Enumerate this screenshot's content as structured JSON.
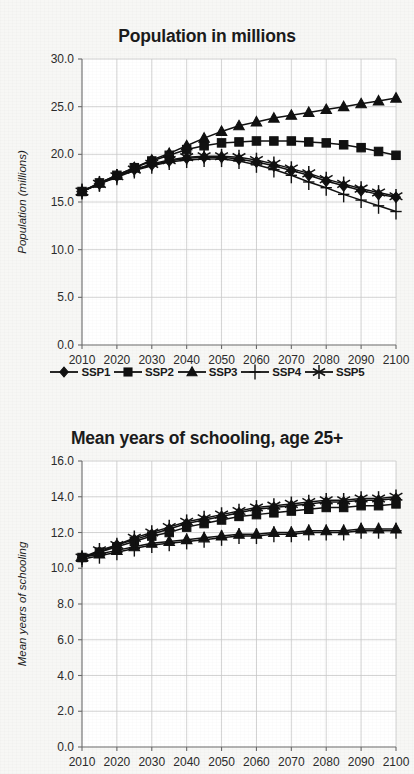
{
  "page": {
    "background_color": "#f7f7f5",
    "ink_color": "#111111",
    "grid_color": "#c9c9c9"
  },
  "legend": {
    "position": "below-top-chart",
    "items": [
      {
        "label": "SSP1",
        "marker": "diamond-marker-icon"
      },
      {
        "label": "SSP2",
        "marker": "square-marker-icon"
      },
      {
        "label": "SSP3",
        "marker": "triangle-marker-icon"
      },
      {
        "label": "SSP4",
        "marker": "plus-marker-icon"
      },
      {
        "label": "SSP5",
        "marker": "asterisk-marker-icon"
      }
    ]
  },
  "chart_data": [
    {
      "id": "population",
      "type": "line",
      "title": "Population in millions",
      "xlabel": "",
      "ylabel": "Population (millions)",
      "x": [
        2010,
        2015,
        2020,
        2025,
        2030,
        2035,
        2040,
        2045,
        2050,
        2055,
        2060,
        2065,
        2070,
        2075,
        2080,
        2085,
        2090,
        2095,
        2100
      ],
      "xlim": [
        2010,
        2100
      ],
      "ylim": [
        0.0,
        30.0
      ],
      "xticks": [
        2010,
        2020,
        2030,
        2040,
        2050,
        2060,
        2070,
        2080,
        2090,
        2100
      ],
      "xtick_labels": [
        "2010",
        "2020",
        "2030",
        "2040",
        "2050",
        "2060",
        "2070",
        "2080",
        "2090",
        "2100"
      ],
      "yticks": [
        0.0,
        5.0,
        10.0,
        15.0,
        20.0,
        25.0,
        30.0
      ],
      "ytick_labels": [
        "0.0",
        "5.0",
        "10.0",
        "15.0",
        "20.0",
        "25.0",
        "30.0"
      ],
      "grid": true,
      "legend_position": "below",
      "series": [
        {
          "name": "SSP1",
          "marker": "diamond",
          "values": [
            16.1,
            16.9,
            17.7,
            18.4,
            18.9,
            19.3,
            19.6,
            19.7,
            19.7,
            19.5,
            19.2,
            18.8,
            18.3,
            17.8,
            17.2,
            16.7,
            16.2,
            15.8,
            15.5
          ]
        },
        {
          "name": "SSP2",
          "marker": "square",
          "values": [
            16.1,
            17.0,
            17.8,
            18.6,
            19.3,
            19.9,
            20.5,
            20.9,
            21.2,
            21.3,
            21.4,
            21.4,
            21.4,
            21.3,
            21.2,
            21.0,
            20.7,
            20.3,
            19.9
          ]
        },
        {
          "name": "SSP3",
          "marker": "triangle",
          "values": [
            16.1,
            17.0,
            17.8,
            18.6,
            19.4,
            20.1,
            20.9,
            21.7,
            22.4,
            23.0,
            23.4,
            23.8,
            24.1,
            24.4,
            24.7,
            25.0,
            25.3,
            25.6,
            25.9
          ]
        },
        {
          "name": "SSP4",
          "marker": "plus",
          "values": [
            16.1,
            16.9,
            17.6,
            18.3,
            18.8,
            19.2,
            19.4,
            19.5,
            19.5,
            19.3,
            18.9,
            18.4,
            17.8,
            17.1,
            16.5,
            15.8,
            15.2,
            14.6,
            14.0
          ]
        },
        {
          "name": "SSP5",
          "marker": "asterisk",
          "values": [
            16.1,
            16.9,
            17.7,
            18.4,
            19.0,
            19.4,
            19.7,
            19.8,
            19.8,
            19.7,
            19.4,
            19.0,
            18.5,
            18.0,
            17.4,
            16.9,
            16.4,
            16.0,
            15.6
          ]
        }
      ]
    },
    {
      "id": "schooling",
      "type": "line",
      "title": "Mean years of schooling, age 25+",
      "xlabel": "",
      "ylabel": "Mean years of schooling",
      "x": [
        2010,
        2015,
        2020,
        2025,
        2030,
        2035,
        2040,
        2045,
        2050,
        2055,
        2060,
        2065,
        2070,
        2075,
        2080,
        2085,
        2090,
        2095,
        2100
      ],
      "xlim": [
        2010,
        2100
      ],
      "ylim": [
        0.0,
        16.0
      ],
      "xticks": [
        2010,
        2020,
        2030,
        2040,
        2050,
        2060,
        2070,
        2080,
        2090,
        2100
      ],
      "xtick_labels": [
        "2010",
        "2020",
        "2030",
        "2040",
        "2050",
        "2060",
        "2070",
        "2080",
        "2090",
        "2100"
      ],
      "yticks": [
        0.0,
        2.0,
        4.0,
        6.0,
        8.0,
        10.0,
        12.0,
        14.0,
        16.0
      ],
      "ytick_labels": [
        "0.0",
        "2.0",
        "4.0",
        "6.0",
        "8.0",
        "10.0",
        "12.0",
        "14.0",
        "16.0"
      ],
      "grid": true,
      "legend_position": "none",
      "series": [
        {
          "name": "SSP1",
          "marker": "diamond",
          "values": [
            10.6,
            10.9,
            11.3,
            11.6,
            11.9,
            12.2,
            12.5,
            12.7,
            12.9,
            13.1,
            13.3,
            13.4,
            13.5,
            13.6,
            13.7,
            13.7,
            13.8,
            13.8,
            13.9
          ]
        },
        {
          "name": "SSP2",
          "marker": "square",
          "values": [
            10.6,
            10.9,
            11.2,
            11.5,
            11.8,
            12.0,
            12.3,
            12.5,
            12.7,
            12.9,
            13.0,
            13.1,
            13.2,
            13.3,
            13.4,
            13.4,
            13.5,
            13.5,
            13.6
          ]
        },
        {
          "name": "SSP3",
          "marker": "triangle",
          "values": [
            10.6,
            10.8,
            11.0,
            11.2,
            11.4,
            11.5,
            11.6,
            11.7,
            11.8,
            11.9,
            11.9,
            12.0,
            12.0,
            12.1,
            12.1,
            12.1,
            12.2,
            12.2,
            12.2
          ]
        },
        {
          "name": "SSP4",
          "marker": "plus",
          "values": [
            10.5,
            10.7,
            10.9,
            11.1,
            11.3,
            11.4,
            11.5,
            11.6,
            11.7,
            11.8,
            11.8,
            11.9,
            11.9,
            12.0,
            12.0,
            12.0,
            12.1,
            12.1,
            12.1
          ]
        },
        {
          "name": "SSP5",
          "marker": "asterisk",
          "values": [
            10.6,
            11.0,
            11.3,
            11.7,
            12.0,
            12.3,
            12.6,
            12.8,
            13.0,
            13.2,
            13.4,
            13.5,
            13.6,
            13.7,
            13.8,
            13.8,
            13.9,
            13.9,
            14.0
          ]
        }
      ]
    }
  ]
}
